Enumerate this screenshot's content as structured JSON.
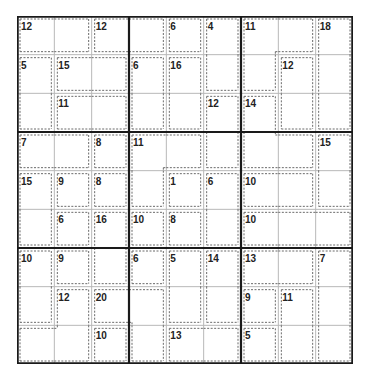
{
  "puzzle": {
    "type": "killer-sudoku",
    "size": 9,
    "colors": {
      "grid_thick": "#1a1a1a",
      "grid_thin": "#b8b8b8",
      "cage_dash": "#6a6a6a",
      "clue_text": "#222222",
      "background": "#ffffff"
    },
    "cages": [
      {
        "sum": "12",
        "cells": [
          [
            0,
            0
          ],
          [
            0,
            1
          ]
        ]
      },
      {
        "sum": "12",
        "cells": [
          [
            0,
            2
          ],
          [
            0,
            3
          ]
        ]
      },
      {
        "sum": "6",
        "cells": [
          [
            0,
            4
          ]
        ]
      },
      {
        "sum": "4",
        "cells": [
          [
            0,
            5
          ],
          [
            1,
            5
          ]
        ]
      },
      {
        "sum": "11",
        "cells": [
          [
            0,
            6
          ],
          [
            0,
            7
          ],
          [
            1,
            6
          ]
        ]
      },
      {
        "sum": "18",
        "cells": [
          [
            0,
            8
          ],
          [
            1,
            8
          ],
          [
            2,
            8
          ]
        ]
      },
      {
        "sum": "5",
        "cells": [
          [
            1,
            0
          ],
          [
            2,
            0
          ]
        ]
      },
      {
        "sum": "15",
        "cells": [
          [
            1,
            1
          ],
          [
            1,
            2
          ]
        ]
      },
      {
        "sum": "6",
        "cells": [
          [
            1,
            3
          ],
          [
            2,
            3
          ]
        ]
      },
      {
        "sum": "16",
        "cells": [
          [
            1,
            4
          ],
          [
            2,
            4
          ]
        ]
      },
      {
        "sum": "12",
        "cells": [
          [
            1,
            7
          ],
          [
            2,
            7
          ]
        ]
      },
      {
        "sum": "11",
        "cells": [
          [
            2,
            1
          ],
          [
            2,
            2
          ]
        ]
      },
      {
        "sum": "12",
        "cells": [
          [
            2,
            5
          ],
          [
            3,
            5
          ]
        ]
      },
      {
        "sum": "14",
        "cells": [
          [
            2,
            6
          ],
          [
            3,
            6
          ],
          [
            3,
            7
          ]
        ]
      },
      {
        "sum": "7",
        "cells": [
          [
            3,
            0
          ],
          [
            3,
            1
          ]
        ]
      },
      {
        "sum": "8",
        "cells": [
          [
            3,
            2
          ]
        ]
      },
      {
        "sum": "11",
        "cells": [
          [
            3,
            3
          ],
          [
            3,
            4
          ],
          [
            4,
            3
          ]
        ]
      },
      {
        "sum": "15",
        "cells": [
          [
            3,
            8
          ],
          [
            4,
            8
          ]
        ]
      },
      {
        "sum": "15",
        "cells": [
          [
            4,
            0
          ],
          [
            5,
            0
          ]
        ]
      },
      {
        "sum": "9",
        "cells": [
          [
            4,
            1
          ]
        ]
      },
      {
        "sum": "8",
        "cells": [
          [
            4,
            2
          ]
        ]
      },
      {
        "sum": "1",
        "cells": [
          [
            4,
            4
          ]
        ]
      },
      {
        "sum": "6",
        "cells": [
          [
            4,
            5
          ],
          [
            5,
            5
          ]
        ]
      },
      {
        "sum": "10",
        "cells": [
          [
            4,
            6
          ],
          [
            4,
            7
          ]
        ]
      },
      {
        "sum": "6",
        "cells": [
          [
            5,
            1
          ]
        ]
      },
      {
        "sum": "16",
        "cells": [
          [
            5,
            2
          ],
          [
            6,
            2
          ]
        ]
      },
      {
        "sum": "10",
        "cells": [
          [
            5,
            3
          ]
        ]
      },
      {
        "sum": "8",
        "cells": [
          [
            5,
            4
          ]
        ]
      },
      {
        "sum": "10",
        "cells": [
          [
            5,
            6
          ],
          [
            5,
            7
          ],
          [
            5,
            8
          ]
        ]
      },
      {
        "sum": "10",
        "cells": [
          [
            6,
            0
          ],
          [
            7,
            0
          ]
        ]
      },
      {
        "sum": "9",
        "cells": [
          [
            6,
            1
          ]
        ]
      },
      {
        "sum": "6",
        "cells": [
          [
            6,
            3
          ]
        ]
      },
      {
        "sum": "5",
        "cells": [
          [
            6,
            4
          ],
          [
            7,
            4
          ]
        ]
      },
      {
        "sum": "14",
        "cells": [
          [
            6,
            5
          ],
          [
            7,
            5
          ]
        ]
      },
      {
        "sum": "13",
        "cells": [
          [
            6,
            6
          ],
          [
            6,
            7
          ]
        ]
      },
      {
        "sum": "7",
        "cells": [
          [
            6,
            8
          ],
          [
            7,
            8
          ],
          [
            8,
            8
          ]
        ]
      },
      {
        "sum": "12",
        "cells": [
          [
            7,
            1
          ],
          [
            8,
            1
          ],
          [
            8,
            0
          ]
        ]
      },
      {
        "sum": "20",
        "cells": [
          [
            7,
            2
          ],
          [
            7,
            3
          ],
          [
            8,
            3
          ]
        ]
      },
      {
        "sum": "9",
        "cells": [
          [
            7,
            6
          ]
        ]
      },
      {
        "sum": "11",
        "cells": [
          [
            7,
            7
          ],
          [
            8,
            7
          ]
        ]
      },
      {
        "sum": "10",
        "cells": [
          [
            8,
            2
          ]
        ]
      },
      {
        "sum": "13",
        "cells": [
          [
            8,
            4
          ],
          [
            8,
            5
          ]
        ]
      },
      {
        "sum": "5",
        "cells": [
          [
            8,
            6
          ]
        ]
      }
    ]
  }
}
